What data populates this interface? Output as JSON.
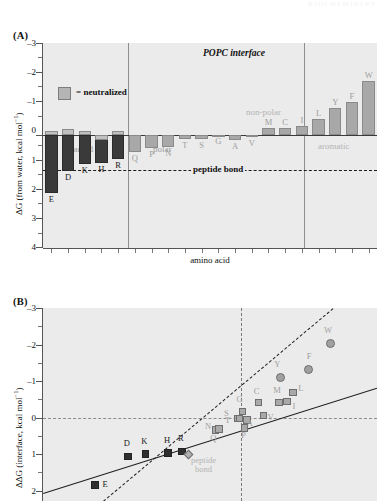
{
  "figure": {
    "running_header": "BIOCHEMISTRY",
    "panel_a_letter": "(A)",
    "panel_b_letter": "(B)"
  },
  "panel_a": {
    "title": "POPC interface",
    "ylabel_prefix": "ΔG (from water, kcal mol",
    "ylabel_sup": "−1",
    "ylabel_suffix": ")",
    "xlabel": "amino acid",
    "legend": {
      "label": "= neutralized",
      "swatch_color": "#b5b5b5"
    },
    "peptide_bond_label": "peptide bond",
    "peptide_bond_value": 1.2,
    "group_labels": [
      {
        "text": "charged",
        "color": "#9d9d9d"
      },
      {
        "text": "polar",
        "color": "#9d9d9d"
      },
      {
        "text": "non-polar",
        "color": "#b4b4b4"
      },
      {
        "text": "aromatic",
        "color": "#b4b4b4"
      }
    ],
    "yticks": [
      -3,
      -2,
      -1,
      0,
      1,
      2,
      3,
      4
    ],
    "ylim": [
      -3,
      4
    ],
    "group_dividers_after": [
      4,
      14
    ]
  },
  "panel_b": {
    "ylabel_prefix": "ΔΔG (interface, kcal mol",
    "ylabel_sup": "−1",
    "ylabel_suffix": ")",
    "yticks": [
      -3,
      -2,
      -1,
      0,
      1,
      2
    ],
    "ylim": [
      -3,
      2.4
    ],
    "annotation": {
      "line1": "peptide",
      "line2": "bond",
      "color": "#b4b4b4"
    }
  },
  "chart_data": [
    {
      "type": "bar",
      "id": "panel-a",
      "title": "POPC interface",
      "xlabel": "amino acid",
      "ylabel": "ΔG (from water, kcal mol⁻¹)",
      "ylim": [
        -3,
        4
      ],
      "y_axis_inverted": true,
      "grid": false,
      "legend": "= neutralized",
      "reference_lines": [
        {
          "label": "peptide bond",
          "value": 1.2,
          "style": "dashed"
        },
        {
          "label": "zero",
          "value": 0,
          "style": "solid"
        }
      ],
      "categories": [
        "E",
        "D",
        "K",
        "H",
        "R",
        "Q",
        "P",
        "N",
        "T",
        "S",
        "G",
        "A",
        "V",
        "M",
        "C",
        "I",
        "L",
        "Y",
        "F",
        "W"
      ],
      "values": [
        1.99,
        1.23,
        0.99,
        0.96,
        0.81,
        0.58,
        0.45,
        0.42,
        0.14,
        0.13,
        0.01,
        0.17,
        0.07,
        -0.23,
        -0.24,
        -0.31,
        -0.56,
        -0.94,
        -1.13,
        -1.85
      ],
      "neutralized_values": [
        -0.01,
        -0.07,
        0.0,
        0.17,
        0.0,
        null,
        null,
        null,
        null,
        null,
        null,
        null,
        null,
        null,
        null,
        null,
        null,
        null,
        null,
        null
      ],
      "bar_styles": [
        "dark",
        "dark",
        "dark",
        "dark",
        "dark",
        "light",
        "light",
        "light",
        "light",
        "light",
        "light",
        "light",
        "light",
        "light",
        "light",
        "light",
        "light",
        "light",
        "light",
        "light"
      ],
      "label_colors": [
        "dark",
        "dark",
        "dark",
        "dark",
        "dark",
        "grey",
        "grey",
        "grey",
        "grey",
        "grey",
        "grey",
        "grey",
        "grey",
        "grey",
        "grey",
        "grey",
        "grey",
        "grey",
        "grey",
        "grey"
      ],
      "groups": [
        {
          "name": "charged",
          "members": [
            "E",
            "D",
            "K",
            "H",
            "R"
          ]
        },
        {
          "name": "polar",
          "members": [
            "Q",
            "P",
            "N",
            "T",
            "S",
            "G",
            "A",
            "V"
          ]
        },
        {
          "name": "non-polar",
          "members": [
            "M",
            "C",
            "I",
            "L"
          ]
        },
        {
          "name": "aromatic",
          "members": [
            "Y",
            "F",
            "W"
          ]
        }
      ]
    },
    {
      "type": "scatter",
      "id": "panel-b",
      "ylabel": "ΔΔG (interface, kcal mol⁻¹)",
      "xlabel": "",
      "ylim": [
        -3,
        2.4
      ],
      "y_axis_inverted": true,
      "grid": false,
      "reference_lines": [
        {
          "orientation": "horizontal",
          "value": 0,
          "style": "dashed-grey"
        },
        {
          "orientation": "vertical",
          "value": 0,
          "style": "dashed-grey"
        }
      ],
      "annotations": [
        {
          "text": "peptide bond",
          "color": "#b4b4b4"
        }
      ],
      "trend_lines": [
        {
          "style": "solid",
          "description": "shallow regression line"
        },
        {
          "style": "dashed",
          "description": "steep reference line"
        }
      ],
      "points": [
        {
          "label": "E",
          "x": -2.0,
          "y": 1.83,
          "marker": "square-dark"
        },
        {
          "label": "D",
          "x": -1.55,
          "y": 1.05,
          "marker": "square-dark"
        },
        {
          "label": "K",
          "x": -1.31,
          "y": 0.98,
          "marker": "square-dark"
        },
        {
          "label": "H",
          "x": -1.0,
          "y": 0.96,
          "marker": "square-dark"
        },
        {
          "label": "R",
          "x": -0.81,
          "y": 0.92,
          "marker": "square-dark"
        },
        {
          "label": "peptide bond",
          "x": -0.72,
          "y": 1.0,
          "marker": "diamond-grey"
        },
        {
          "label": "Q",
          "x": -0.35,
          "y": 0.33,
          "marker": "square-grey"
        },
        {
          "label": "N",
          "x": -0.3,
          "y": 0.3,
          "marker": "square-grey"
        },
        {
          "label": "S",
          "x": -0.05,
          "y": 0.02,
          "marker": "square-grey"
        },
        {
          "label": "T",
          "x": -0.02,
          "y": 0.01,
          "marker": "square-grey"
        },
        {
          "label": "G",
          "x": 0.02,
          "y": -0.18,
          "marker": "square-grey"
        },
        {
          "label": "P",
          "x": 0.05,
          "y": 0.27,
          "marker": "square-grey"
        },
        {
          "label": "A",
          "x": 0.08,
          "y": 0.05,
          "marker": "square-grey"
        },
        {
          "label": "C",
          "x": 0.24,
          "y": -0.42,
          "marker": "square-grey"
        },
        {
          "label": "V",
          "x": 0.31,
          "y": -0.07,
          "marker": "square-grey"
        },
        {
          "label": "M",
          "x": 0.52,
          "y": -0.43,
          "marker": "square-grey"
        },
        {
          "label": "I",
          "x": 0.63,
          "y": -0.45,
          "marker": "square-grey"
        },
        {
          "label": "L",
          "x": 0.71,
          "y": -0.7,
          "marker": "square-grey"
        },
        {
          "label": "Y",
          "x": 0.54,
          "y": -1.12,
          "marker": "circle-grey"
        },
        {
          "label": "F",
          "x": 0.92,
          "y": -1.33,
          "marker": "circle-grey"
        },
        {
          "label": "W",
          "x": 1.22,
          "y": -2.04,
          "marker": "circle-grey"
        }
      ]
    }
  ]
}
